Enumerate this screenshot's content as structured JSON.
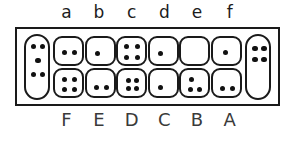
{
  "diagram": {
    "colors": {
      "ink": "#111111",
      "outline": "#1a1a1a",
      "background": "#ffffff"
    },
    "top_labels": [
      "a",
      "b",
      "c",
      "d",
      "e",
      "f"
    ],
    "bottom_labels": [
      "F",
      "E",
      "D",
      "C",
      "B",
      "A"
    ],
    "left_capsule": {
      "name": "left-capsule",
      "dot_count": 5,
      "dots": [
        {
          "x": 5,
          "y": 8
        },
        {
          "x": 14,
          "y": 8
        },
        {
          "x": 9.5,
          "y": 22
        },
        {
          "x": 5,
          "y": 36
        },
        {
          "x": 14,
          "y": 36
        }
      ]
    },
    "right_capsule": {
      "name": "right-capsule",
      "dot_count": 4,
      "dots": [
        {
          "x": 5,
          "y": 10
        },
        {
          "x": 14,
          "y": 10
        },
        {
          "x": 5,
          "y": 21
        },
        {
          "x": 14,
          "y": 21
        }
      ]
    },
    "columns": [
      {
        "top_label": "a",
        "bottom_label": "F",
        "top_cell": {
          "dot_count": 2,
          "dots": [
            {
              "x": 7,
              "y": 12
            },
            {
              "x": 17,
              "y": 12
            }
          ]
        },
        "bottom_cell": {
          "dot_count": 4,
          "dots": [
            {
              "x": 7,
              "y": 7
            },
            {
              "x": 17,
              "y": 7
            },
            {
              "x": 7,
              "y": 17
            },
            {
              "x": 17,
              "y": 17
            }
          ]
        }
      },
      {
        "top_label": "b",
        "bottom_label": "E",
        "top_cell": {
          "dot_count": 1,
          "dots": [
            {
              "x": 8,
              "y": 13
            }
          ]
        },
        "bottom_cell": {
          "dot_count": 2,
          "dots": [
            {
              "x": 7,
              "y": 15
            },
            {
              "x": 17,
              "y": 15
            }
          ]
        }
      },
      {
        "top_label": "c",
        "bottom_label": "D",
        "top_cell": {
          "dot_count": 4,
          "dots": [
            {
              "x": 6,
              "y": 6
            },
            {
              "x": 17,
              "y": 6
            },
            {
              "x": 6,
              "y": 17
            },
            {
              "x": 17,
              "y": 17
            }
          ]
        },
        "bottom_cell": {
          "dot_count": 4,
          "dots": [
            {
              "x": 8,
              "y": 8
            },
            {
              "x": 16,
              "y": 8
            },
            {
              "x": 8,
              "y": 16
            },
            {
              "x": 16,
              "y": 16
            }
          ]
        }
      },
      {
        "top_label": "d",
        "bottom_label": "C",
        "top_cell": {
          "dot_count": 1,
          "dots": [
            {
              "x": 8,
              "y": 13
            }
          ]
        },
        "bottom_cell": {
          "dot_count": 1,
          "dots": [
            {
              "x": 8,
              "y": 15
            }
          ]
        }
      },
      {
        "top_label": "e",
        "bottom_label": "B",
        "top_cell": {
          "dot_count": 0,
          "dots": []
        },
        "bottom_cell": {
          "dot_count": 3,
          "dots": [
            {
              "x": 8,
              "y": 7
            },
            {
              "x": 7,
              "y": 17
            },
            {
              "x": 16,
              "y": 17
            }
          ]
        }
      },
      {
        "top_label": "f",
        "bottom_label": "A",
        "top_cell": {
          "dot_count": 1,
          "dots": [
            {
              "x": 10,
              "y": 12
            }
          ]
        },
        "bottom_cell": {
          "dot_count": 2,
          "dots": [
            {
              "x": 7,
              "y": 16
            },
            {
              "x": 17,
              "y": 16
            }
          ]
        }
      }
    ]
  }
}
